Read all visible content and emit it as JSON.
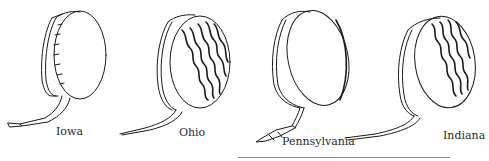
{
  "figure": {
    "items": [
      {
        "label": "Iowa",
        "style": "plain"
      },
      {
        "label": "Ohio",
        "style": "quilted"
      },
      {
        "label": "Pennsylvania",
        "style": "plain"
      },
      {
        "label": "Indiana",
        "style": "quilted"
      }
    ],
    "ink_color": "#1a1a1a",
    "rule_color": "#8a8a8a"
  }
}
